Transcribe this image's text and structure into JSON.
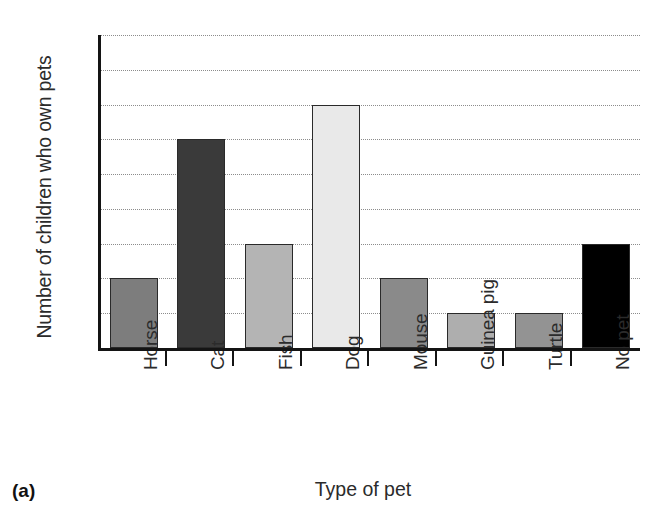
{
  "caption": "(a)",
  "chart_data": {
    "type": "bar",
    "title": "",
    "xlabel": "Type of pet",
    "ylabel": "Number of children who own pets",
    "categories": [
      "Horse",
      "Cat",
      "Fish",
      "Dog",
      "Mouse",
      "Guinea pig",
      "Turtle",
      "No pet"
    ],
    "values": [
      2,
      6,
      3,
      7,
      2,
      1,
      1,
      3
    ],
    "bar_colors": [
      "#7d7d7d",
      "#3a3a3a",
      "#b4b4b4",
      "#e9e9e9",
      "#8a8a8a",
      "#aeaeae",
      "#939393",
      "#000000"
    ],
    "ylim": [
      0,
      9
    ],
    "ytick_labels": [
      "0",
      "1",
      "2",
      "3",
      "4",
      "5",
      "6",
      "7",
      "8",
      "9"
    ],
    "ytick_values": [
      0,
      1,
      2,
      3,
      4,
      5,
      6,
      7,
      8,
      9
    ],
    "grid": true,
    "grid_style": "dotted-horizontal",
    "legend": "none",
    "xtick_label_rotation": -90
  }
}
